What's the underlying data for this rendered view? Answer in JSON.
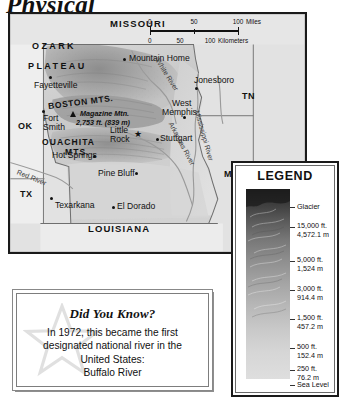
{
  "page": {
    "title": "Physical"
  },
  "map": {
    "scale_bar": {
      "miles": {
        "ticks": [
          "0",
          "50",
          "100"
        ],
        "unit": "Miles"
      },
      "kilometers": {
        "ticks": [
          "0",
          "50",
          "100"
        ],
        "unit": "Kilometers"
      }
    },
    "states": [
      {
        "name": "MISSOURI",
        "style": "full"
      },
      {
        "name": "LOUISIANA",
        "style": "full"
      },
      {
        "name": "TN",
        "style": "abbrev"
      },
      {
        "name": "MS",
        "style": "abbrev"
      },
      {
        "name": "TX",
        "style": "abbrev"
      },
      {
        "name": "OK",
        "style": "abbrev"
      }
    ],
    "regions": [
      {
        "name": "OZARK"
      },
      {
        "name": "PLATEAU"
      },
      {
        "name": "BOSTON MTS."
      },
      {
        "name": "OUACHITA"
      },
      {
        "name": "MTS."
      }
    ],
    "cities": [
      {
        "name": "Mountain Home",
        "capital": false
      },
      {
        "name": "Jonesboro",
        "capital": false
      },
      {
        "name": "Fayetteville",
        "capital": false
      },
      {
        "name": "Fort",
        "capital": false
      },
      {
        "name": "Smith",
        "capital": false
      },
      {
        "name": "West",
        "capital": false
      },
      {
        "name": "Memphis",
        "capital": false
      },
      {
        "name": "Little",
        "capital": true
      },
      {
        "name": "Rock",
        "capital": true
      },
      {
        "name": "Stuttgart",
        "capital": false
      },
      {
        "name": "Hot Springs",
        "capital": false
      },
      {
        "name": "Pine Bluff",
        "capital": false
      },
      {
        "name": "Texarkana",
        "capital": false
      },
      {
        "name": "El Dorado",
        "capital": false
      }
    ],
    "peak": {
      "name": "Magazine Mtn.",
      "elevation": "2,753 ft. (839 m)"
    },
    "rivers": [
      {
        "name": "White River"
      },
      {
        "name": "Arkansas River"
      },
      {
        "name": "Mississippi River"
      },
      {
        "name": "Red  River"
      }
    ]
  },
  "legend": {
    "title": "LEGEND",
    "entries": [
      {
        "label": "Glacier",
        "meters": ""
      },
      {
        "label": "15,000 ft.",
        "meters": "4,572.1 m"
      },
      {
        "label": "5,000 ft.",
        "meters": "1,524 m"
      },
      {
        "label": "3,000 ft.",
        "meters": "914.4 m"
      },
      {
        "label": "1,500 ft.",
        "meters": "457.2 m"
      },
      {
        "label": "500 ft.",
        "meters": "152.4 m"
      },
      {
        "label": "250 ft.",
        "meters": "76.2 m"
      },
      {
        "label": "Sea Level",
        "meters": ""
      }
    ]
  },
  "did_you_know": {
    "heading": "Did You Know?",
    "body": "In 1972, this became the first designated national river in the United States:",
    "answer": "Buffalo River"
  }
}
